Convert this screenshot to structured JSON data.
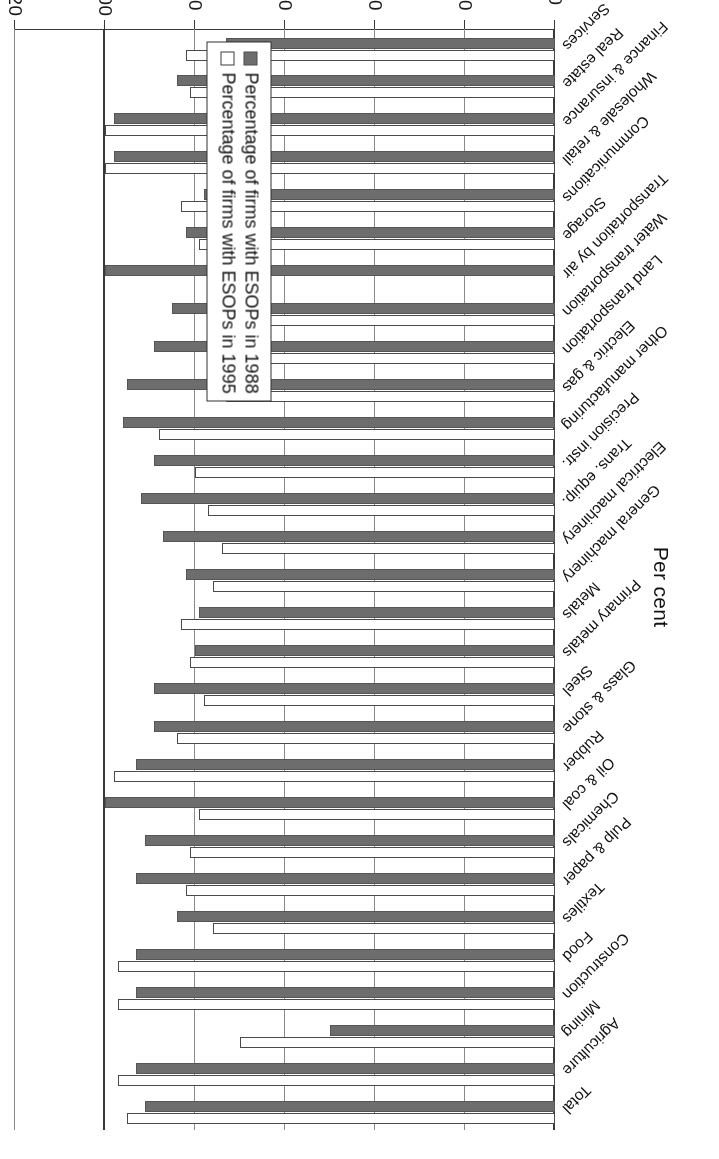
{
  "chart_data": {
    "type": "bar",
    "orientation": "horizontal",
    "title": "",
    "xlabel": "Per cent",
    "ylabel": "",
    "xlim": [
      0,
      120
    ],
    "xticks": [
      0,
      20,
      40,
      60,
      80,
      100,
      120
    ],
    "xtick_labels": [
      "0",
      "20",
      "40",
      "60",
      "80",
      "100",
      "120"
    ],
    "grid": true,
    "legend_position": "bottom-right",
    "categories": [
      "Total",
      "Agriculture",
      "Mining",
      "Construction",
      "Food",
      "Textiles",
      "Pulp & paper",
      "Chemicals",
      "Oil & coal",
      "Rubber",
      "Glass & stone",
      "Steel",
      "Primary metals",
      "Metals",
      "General machinery",
      "Electrical machinery",
      "Trans. equip.",
      "Precision instr.",
      "Other manufacturing",
      "Electric & gas",
      "Land transportation",
      "Water transportation",
      "Transportation by air",
      "Storage",
      "Communications",
      "Wholesale & retail",
      "Finance & insurance",
      "Real estate",
      "Services"
    ],
    "series": [
      {
        "name": "Percentage of firms with ESOPs in 1988",
        "key": "s1988",
        "color": "#6d6d6d",
        "values": [
          91,
          93,
          50,
          93,
          93,
          84,
          93,
          91,
          100,
          93,
          89,
          89,
          80,
          79,
          82,
          87,
          92,
          89,
          96,
          95,
          89,
          85,
          100,
          82,
          78,
          98,
          98,
          84,
          73
        ]
      },
      {
        "name": "Percentage of firms with ESOPs in 1995",
        "key": "s1995",
        "color": "#ffffff",
        "values": [
          95,
          97,
          70,
          97,
          97,
          76,
          82,
          81,
          79,
          98,
          84,
          78,
          81,
          83,
          76,
          74,
          77,
          80,
          88,
          73,
          75,
          72,
          0,
          79,
          83,
          100,
          100,
          81,
          82
        ]
      }
    ]
  },
  "axis": {
    "value_axis_title": "Per cent",
    "tick_labels": [
      "0",
      "20",
      "40",
      "60",
      "80",
      "100",
      "120"
    ]
  },
  "legend": {
    "items": [
      {
        "label": "Percentage of firms with ESOPs in 1988",
        "swatch": "s1988"
      },
      {
        "label": "Percentage of firms with ESOPs in 1995",
        "swatch": "s1995"
      }
    ]
  }
}
